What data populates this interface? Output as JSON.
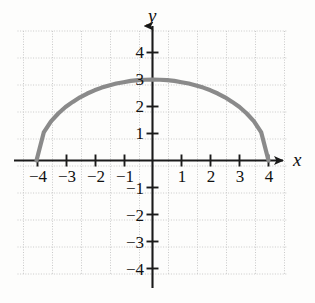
{
  "figure": {
    "axis_labels": {
      "x": "x",
      "y": "y"
    },
    "curve_color": "#8a8a8a",
    "axis_color": "#1a1a1a",
    "grid_color": "#c9c9c9",
    "background": "#fdfdfc"
  },
  "chart_data": {
    "type": "line",
    "title": "",
    "xlabel": "x",
    "ylabel": "y",
    "xlim": [
      -4.6,
      4.6
    ],
    "ylim": [
      -4.6,
      4.6
    ],
    "grid": true,
    "grid_step": 1,
    "legend": "none",
    "x_ticks": [
      -4,
      -3,
      -2,
      -1,
      1,
      2,
      3,
      4
    ],
    "x_tick_labels": [
      "−4",
      "−3",
      "−2",
      "−1",
      "1",
      "2",
      "3",
      "4"
    ],
    "y_ticks": [
      4,
      3,
      2,
      1,
      -1,
      -2,
      -3,
      -4
    ],
    "y_tick_labels": [
      "4",
      "3",
      "2",
      "1",
      "−1",
      "−2",
      "−3",
      "−4"
    ],
    "series": [
      {
        "name": "upper half ellipse",
        "equation": "y = 3*sqrt(1 - x^2/16)",
        "x": [
          -4,
          -3.75,
          -3.5,
          -3.25,
          -3,
          -2.75,
          -2.5,
          -2.25,
          -2,
          -1.75,
          -1.5,
          -1.25,
          -1,
          -0.75,
          -0.5,
          -0.25,
          0,
          0.25,
          0.5,
          0.75,
          1,
          1.25,
          1.5,
          1.75,
          2,
          2.25,
          2.5,
          2.75,
          3,
          3.25,
          3.5,
          3.75,
          4
        ],
        "y": [
          0,
          1.04,
          1.45,
          1.74,
          1.98,
          2.17,
          2.34,
          2.48,
          2.6,
          2.7,
          2.78,
          2.85,
          2.9,
          2.95,
          2.98,
          2.99,
          3,
          2.99,
          2.98,
          2.95,
          2.9,
          2.85,
          2.78,
          2.7,
          2.6,
          2.48,
          2.34,
          2.17,
          1.98,
          1.74,
          1.45,
          1.04,
          0
        ]
      }
    ]
  }
}
